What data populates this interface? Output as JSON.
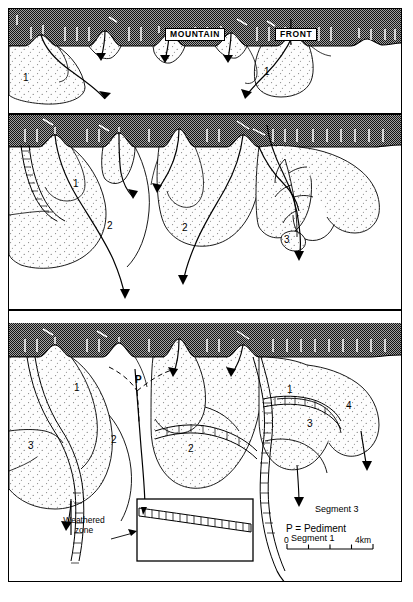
{
  "figure": {
    "title_labels": {
      "mountain": "MOUNTAIN",
      "front": "FRONT"
    },
    "colors": {
      "rock": "#9a9a9a",
      "rock_ink": "#1a1a1a",
      "fan_fill": "#fbfbfb",
      "line": "#000000",
      "background": "#ffffff"
    }
  },
  "panels": [
    {
      "id": "stage-1",
      "name": "panel-stage-1",
      "fan_labels": [
        {
          "text": "1",
          "x": 22,
          "y": 72
        },
        {
          "text": "1",
          "x": 263,
          "y": 67
        }
      ]
    },
    {
      "id": "stage-2",
      "name": "panel-stage-2",
      "fan_labels": [
        {
          "text": "1",
          "x": 72,
          "y": 177
        },
        {
          "text": "2",
          "x": 106,
          "y": 219
        },
        {
          "text": "2",
          "x": 181,
          "y": 221
        },
        {
          "text": "3",
          "x": 283,
          "y": 233
        }
      ]
    },
    {
      "id": "stage-3",
      "name": "panel-stage-3",
      "fan_labels": [
        {
          "text": "1",
          "x": 73,
          "y": 382
        },
        {
          "text": "2",
          "x": 110,
          "y": 434
        },
        {
          "text": "3",
          "x": 27,
          "y": 440
        },
        {
          "text": "2",
          "x": 187,
          "y": 443
        },
        {
          "text": "1",
          "x": 286,
          "y": 384
        },
        {
          "text": "3",
          "x": 306,
          "y": 418
        },
        {
          "text": "4",
          "x": 345,
          "y": 400
        }
      ],
      "pediment_marker": {
        "text": "P",
        "x": 134,
        "y": 374
      }
    }
  ],
  "legend": {
    "inset": {
      "name": "weathered-zone-inset",
      "segment_upper": "Segment 3",
      "segment_lower": "Segment 1"
    },
    "weathered_zone_label_line1": "Weathered",
    "weathered_zone_label_line2": "zone",
    "pediment_key": "P = Pediment",
    "scale": {
      "min": "0",
      "max": "4km",
      "ticks": 4
    }
  }
}
